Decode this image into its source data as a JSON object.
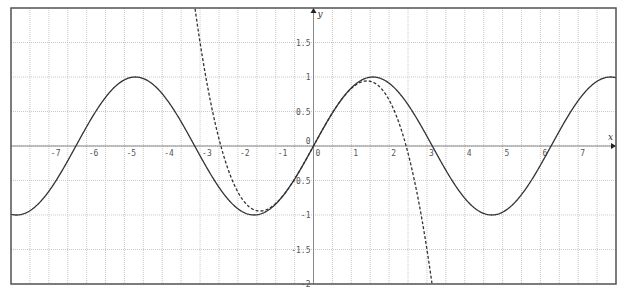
{
  "chart_data": {
    "type": "line",
    "title": "",
    "xlabel": "x",
    "ylabel": "y",
    "xlim": [
      -8,
      8
    ],
    "ylim": [
      -2,
      2
    ],
    "grid": true,
    "grid_step": 0.5,
    "legend": null,
    "x_ticks": [
      -7,
      -6,
      -5,
      -4,
      -3,
      -2,
      -1,
      0,
      1,
      2,
      3,
      4,
      5,
      6,
      7
    ],
    "y_ticks": [
      -2,
      -1.5,
      -1,
      -0.5,
      0,
      0.5,
      1,
      1.5
    ],
    "x_tick_labels": [
      "-7",
      "-6",
      "-5",
      "-4",
      "-3",
      "-2",
      "-1",
      "0",
      "1",
      "2",
      "3",
      "4",
      "5",
      "6",
      "7"
    ],
    "y_tick_labels": [
      "-2",
      "-1.5",
      "-1",
      "-0.5",
      "0",
      "0.5",
      "1",
      "1.5"
    ],
    "series": [
      {
        "name": "sin(x)",
        "style": "solid",
        "color": "#333333",
        "x": [
          -8,
          -7,
          -6,
          -5,
          -4.712,
          -4,
          -3,
          -2,
          -1.571,
          -1,
          0,
          1,
          1.571,
          2,
          3,
          4,
          4.712,
          5,
          6,
          7,
          8
        ],
        "values": [
          -0.989,
          -0.657,
          0.279,
          0.959,
          1.0,
          0.757,
          -0.141,
          -0.909,
          -1.0,
          -0.841,
          0.0,
          0.841,
          1.0,
          0.909,
          0.141,
          -0.757,
          -1.0,
          -0.959,
          -0.279,
          0.657,
          0.989
        ]
      },
      {
        "name": "x - x^3/6",
        "style": "dashed",
        "color": "#333333",
        "x": [
          -3.14,
          -3,
          -2.5,
          -2,
          -1.414,
          -1,
          -0.5,
          0,
          0.5,
          1,
          1.414,
          2,
          2.5,
          3,
          3.14
        ],
        "values": [
          2.0,
          1.5,
          0.104,
          -0.667,
          -0.943,
          -0.833,
          -0.479,
          0.0,
          0.479,
          0.833,
          0.943,
          0.667,
          -0.104,
          -1.5,
          -2.0
        ]
      }
    ]
  },
  "axes": {
    "x_name": "x",
    "y_name": "y",
    "origin_label": "0"
  },
  "colors": {
    "frame": "#555555",
    "grid": "#bbbbbb",
    "curve": "#333333",
    "background": "#ffffff"
  }
}
